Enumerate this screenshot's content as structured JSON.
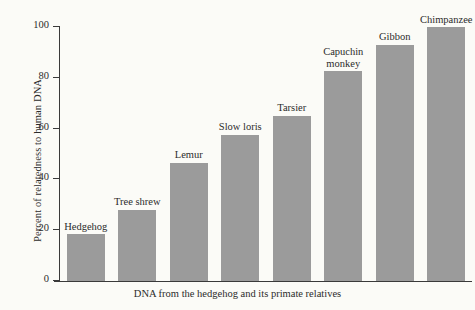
{
  "chart_data": {
    "type": "bar",
    "title": "",
    "subtitle": "",
    "xlabel": "DNA from the hedgehog and its primate relatives",
    "ylabel": "Percent of relatedness to human DNA",
    "ylim": [
      0,
      100
    ],
    "yticks": [
      "0",
      "20",
      "40",
      "60",
      "80",
      "100"
    ],
    "grid": false,
    "legend": "none",
    "bar_color": "#9b9b9b",
    "axis_color": "#3a3a3a",
    "background_color": "#fbfbf7",
    "categories": [
      "Hedgehog",
      "Tree shrew",
      "Lemur",
      "Slow loris",
      "Tarsier",
      "Capuchin monkey",
      "Gibbon",
      "Chimpanzee"
    ],
    "values": [
      18.5,
      28,
      46.5,
      57.5,
      65,
      82.5,
      93,
      100
    ],
    "bars": [
      {
        "label": "Hedgehog",
        "label_lines": [
          "Hedgehog"
        ],
        "value": 18.5
      },
      {
        "label": "Tree shrew",
        "label_lines": [
          "Tree shrew"
        ],
        "value": 28
      },
      {
        "label": "Lemur",
        "label_lines": [
          "Lemur"
        ],
        "value": 46.5
      },
      {
        "label": "Slow loris",
        "label_lines": [
          "Slow loris"
        ],
        "value": 57.5
      },
      {
        "label": "Tarsier",
        "label_lines": [
          "Tarsier"
        ],
        "value": 65
      },
      {
        "label": "Capuchin monkey",
        "label_lines": [
          "Capuchin",
          "monkey"
        ],
        "value": 82.5
      },
      {
        "label": "Gibbon",
        "label_lines": [
          "Gibbon"
        ],
        "value": 93
      },
      {
        "label": "Chimpanzee",
        "label_lines": [
          "Chimpanzee"
        ],
        "value": 100
      }
    ]
  }
}
